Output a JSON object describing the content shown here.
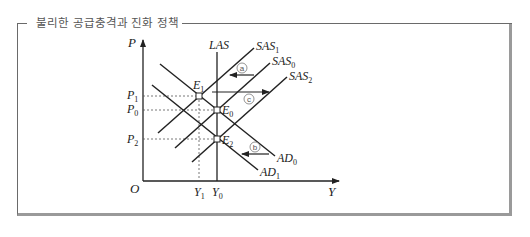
{
  "title": "불리한 공급충격과 진화 정책",
  "axes": {
    "y_label": "P",
    "x_label": "Y",
    "origin_label": "O"
  },
  "price_levels": [
    {
      "name": "P",
      "sub": "1",
      "y": 96
    },
    {
      "name": "P",
      "sub": "0",
      "y": 110
    },
    {
      "name": "P",
      "sub": "2",
      "y": 139
    }
  ],
  "output_levels": [
    {
      "name": "Y",
      "sub": "1",
      "x": 199
    },
    {
      "name": "Y",
      "sub": "0",
      "x": 217
    }
  ],
  "curves": {
    "LAS": {
      "label": "LAS"
    },
    "SAS1": {
      "name": "SAS",
      "sub": "1"
    },
    "SAS0": {
      "name": "SAS",
      "sub": "0"
    },
    "SAS2": {
      "name": "SAS",
      "sub": "2"
    },
    "AD0": {
      "name": "AD",
      "sub": "0"
    },
    "AD1": {
      "name": "AD",
      "sub": "1"
    }
  },
  "equilibria": [
    {
      "name": "E",
      "sub": "1"
    },
    {
      "name": "E",
      "sub": "0"
    },
    {
      "name": "E",
      "sub": "2"
    }
  ],
  "shifts": {
    "a": {
      "label": "a",
      "desc": "SAS0 → SAS1 (leftward)"
    },
    "b": {
      "label": "b",
      "desc": "AD0 → AD1 (leftward)"
    },
    "c": {
      "label": "c",
      "desc": "SAS1 → SAS2 (rightward)"
    }
  },
  "colors": {
    "line": "#222222",
    "frame": "#6a6a6a",
    "frame_shadow": "#9a9a9a",
    "guide": "#555555"
  }
}
